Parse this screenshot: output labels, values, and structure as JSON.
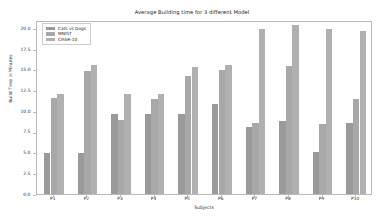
{
  "chart_data": {
    "type": "bar",
    "title": "Average Building time for 3 different Model",
    "xlabel": "Subjects",
    "ylabel": "Build Time in Minutes",
    "categories": [
      "P1",
      "P2",
      "P3",
      "P4",
      "P5",
      "P6",
      "P7",
      "P8",
      "P9",
      "P10"
    ],
    "series": [
      {
        "name": "Cats vs Dogs",
        "color": "#9a9a9a",
        "values": [
          5.0,
          4.9,
          9.6,
          9.7,
          9.6,
          10.9,
          8.1,
          8.8,
          5.1,
          8.6
        ]
      },
      {
        "name": "MNIST",
        "color": "#a8a8a8",
        "values": [
          11.6,
          14.9,
          8.9,
          11.5,
          14.3,
          15.0,
          8.6,
          15.4,
          8.4,
          11.5
        ]
      },
      {
        "name": "CIFAR-10",
        "color": "#b0b0b0",
        "values": [
          12.1,
          15.6,
          12.1,
          12.1,
          15.3,
          15.6,
          19.9,
          20.4,
          19.9,
          19.7
        ]
      }
    ],
    "ylim": [
      0.0,
      21.0
    ],
    "yticks": [
      "0.0",
      "2.5",
      "5.0",
      "7.5",
      "10.0",
      "12.5",
      "15.0",
      "17.5",
      "20.0"
    ],
    "ytick_values": [
      0.0,
      2.5,
      5.0,
      7.5,
      10.0,
      12.5,
      15.0,
      17.5,
      20.0
    ],
    "grid": false,
    "legend_position": "upper left"
  }
}
